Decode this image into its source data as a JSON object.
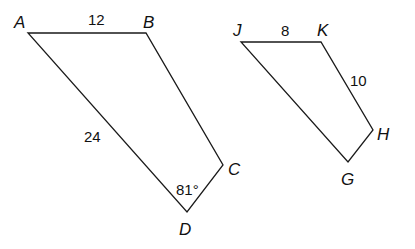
{
  "figures": [
    {
      "name": "ABCD",
      "vertices": [
        {
          "label": "A",
          "x": 28,
          "y": 33,
          "lx": 14,
          "ly": 28
        },
        {
          "label": "B",
          "x": 146,
          "y": 33,
          "lx": 143,
          "ly": 28
        },
        {
          "label": "C",
          "x": 223,
          "y": 165,
          "lx": 228,
          "ly": 175
        },
        {
          "label": "D",
          "x": 187,
          "y": 212,
          "lx": 179,
          "ly": 235
        }
      ],
      "measures": {
        "AB": {
          "text": "12",
          "x": 88,
          "y": 25
        },
        "AD": {
          "text": "24",
          "x": 84,
          "y": 142
        },
        "angleD": {
          "text": "81°",
          "x": 176,
          "y": 195
        }
      }
    },
    {
      "name": "JKHG",
      "vertices": [
        {
          "label": "J",
          "x": 241,
          "y": 42,
          "lx": 233,
          "ly": 36
        },
        {
          "label": "K",
          "x": 321,
          "y": 42,
          "lx": 317,
          "ly": 36
        },
        {
          "label": "H",
          "x": 373,
          "y": 130,
          "lx": 377,
          "ly": 140
        },
        {
          "label": "G",
          "x": 348,
          "y": 162,
          "lx": 341,
          "ly": 185
        }
      ],
      "measures": {
        "JK": {
          "text": "8",
          "x": 281,
          "y": 36
        },
        "KH": {
          "text": "10",
          "x": 350,
          "y": 86
        }
      }
    }
  ]
}
